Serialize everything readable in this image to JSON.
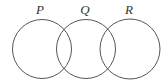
{
  "diagram": {
    "type": "venn",
    "stroke_color": "#555555",
    "sets": [
      {
        "label": "P",
        "cx": 42,
        "cy": 49,
        "r": 29.5
      },
      {
        "label": "Q",
        "cx": 86,
        "cy": 49,
        "r": 29.5
      },
      {
        "label": "R",
        "cx": 130,
        "cy": 49,
        "r": 30
      }
    ]
  }
}
